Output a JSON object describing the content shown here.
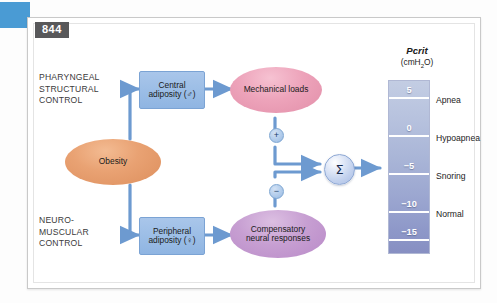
{
  "page": {
    "number": "844",
    "edge_tab_color": "#4a9bd4"
  },
  "diagram": {
    "side_labels": [
      {
        "id": "pharyngeal",
        "text": "PHARYNGEAL\nSTRUCTURAL\nCONTROL"
      },
      {
        "id": "neuromuscular",
        "text": "NEURO-\nMUSCULAR\nCONTROL"
      }
    ],
    "nodes": [
      {
        "id": "obesity",
        "label": "Obesity",
        "shape": "ellipse",
        "color": "#e09a6b"
      },
      {
        "id": "central",
        "label": "Central\nadiposity (♂)",
        "shape": "box",
        "color": "#8fb5e2"
      },
      {
        "id": "peripheral",
        "label": "Peripheral\nadiposity (♀)",
        "shape": "box",
        "color": "#8fb5e2"
      },
      {
        "id": "mechanical",
        "label": "Mechanical loads",
        "shape": "ellipse",
        "color": "#e28fa9"
      },
      {
        "id": "compensatory",
        "label": "Compensatory\nneural responses",
        "shape": "ellipse",
        "color": "#b98ac8"
      }
    ],
    "operators": [
      {
        "id": "plus",
        "symbol": "+",
        "meaning": "increases Pcrit"
      },
      {
        "id": "minus",
        "symbol": "−",
        "meaning": "decreases Pcrit"
      }
    ],
    "summing_junction": {
      "id": "sigma",
      "symbol": "Σ"
    }
  },
  "scale": {
    "title_main": "Pcrit",
    "title_units": "(cmH",
    "title_units_sub": "2",
    "title_units_end": "O)",
    "units": "cmH2O",
    "ticks": [
      {
        "value": "5",
        "pos_pct": 8
      },
      {
        "value": "0",
        "pos_pct": 30
      },
      {
        "value": "−5",
        "pos_pct": 52
      },
      {
        "value": "−10",
        "pos_pct": 74
      },
      {
        "value": "−15",
        "pos_pct": 92
      }
    ],
    "severities": [
      {
        "label": "Apnea",
        "pos_pct": 19
      },
      {
        "label": "Hypoapnea",
        "pos_pct": 41
      },
      {
        "label": "Snoring",
        "pos_pct": 63
      },
      {
        "label": "Normal",
        "pos_pct": 83
      }
    ],
    "outcome_pointer_value": "−5"
  }
}
